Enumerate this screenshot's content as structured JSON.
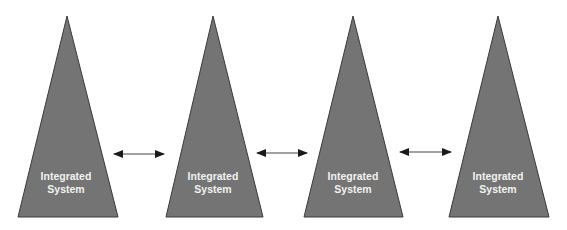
{
  "diagram": {
    "colors": {
      "triangle_fill": "#747474",
      "triangle_stroke": "#3a3a3a",
      "arrow_color": "#1a1a1a",
      "label_color": "#f2f2f2",
      "background": "#ffffff"
    },
    "nodes": [
      {
        "id": "system-1",
        "shape": "triangle",
        "label_line1": "Integrated",
        "label_line2": "System"
      },
      {
        "id": "system-2",
        "shape": "triangle",
        "label_line1": "Integrated",
        "label_line2": "System"
      },
      {
        "id": "system-3",
        "shape": "triangle",
        "label_line1": "Integrated",
        "label_line2": "System"
      },
      {
        "id": "system-4",
        "shape": "triangle",
        "label_line1": "Integrated",
        "label_line2": "System"
      }
    ],
    "edges": [
      {
        "from": "system-1",
        "to": "system-2",
        "type": "bidirectional-arrow"
      },
      {
        "from": "system-2",
        "to": "system-3",
        "type": "bidirectional-arrow"
      },
      {
        "from": "system-3",
        "to": "system-4",
        "type": "bidirectional-arrow"
      }
    ]
  }
}
